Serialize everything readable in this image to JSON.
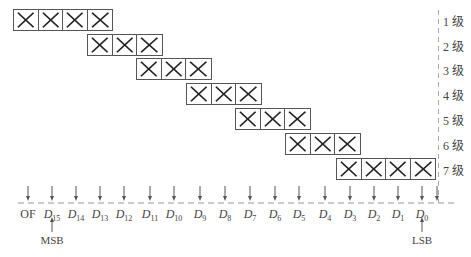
{
  "diagram": {
    "stages": [
      {
        "label": "1 级",
        "cells": 4,
        "x": 13,
        "y": 9
      },
      {
        "label": "2 级",
        "cells": 3,
        "x": 87,
        "y": 34
      },
      {
        "label": "3 级",
        "cells": 3,
        "x": 136,
        "y": 58
      },
      {
        "label": "4 级",
        "cells": 3,
        "x": 186,
        "y": 83
      },
      {
        "label": "5 级",
        "cells": 3,
        "x": 235,
        "y": 108
      },
      {
        "label": "6 级",
        "cells": 3,
        "x": 285,
        "y": 133
      },
      {
        "label": "7 级",
        "cells": 4,
        "x": 336,
        "y": 158
      }
    ],
    "bits": [
      {
        "name": "OF",
        "sub": "",
        "x": 28
      },
      {
        "name": "D",
        "sub": "15",
        "x": 52
      },
      {
        "name": "D",
        "sub": "14",
        "x": 76
      },
      {
        "name": "D",
        "sub": "13",
        "x": 100
      },
      {
        "name": "D",
        "sub": "12",
        "x": 124
      },
      {
        "name": "D",
        "sub": "11",
        "x": 150
      },
      {
        "name": "D",
        "sub": "10",
        "x": 174
      },
      {
        "name": "D",
        "sub": "9",
        "x": 200
      },
      {
        "name": "D",
        "sub": "8",
        "x": 225
      },
      {
        "name": "D",
        "sub": "7",
        "x": 250
      },
      {
        "name": "D",
        "sub": "6",
        "x": 275
      },
      {
        "name": "D",
        "sub": "5",
        "x": 299
      },
      {
        "name": "D",
        "sub": "4",
        "x": 325
      },
      {
        "name": "D",
        "sub": "3",
        "x": 350
      },
      {
        "name": "D",
        "sub": "2",
        "x": 374
      },
      {
        "name": "D",
        "sub": "1",
        "x": 398
      },
      {
        "name": "D",
        "sub": "0",
        "x": 422
      }
    ],
    "extra_arrow_x": 437,
    "msb_label": "MSB",
    "lsb_label": "LSB",
    "colors": {
      "line": "#555555",
      "dash": "#999999",
      "text": "#444444"
    }
  }
}
